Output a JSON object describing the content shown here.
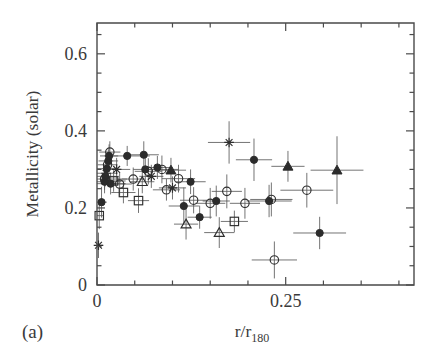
{
  "figure": {
    "panel_label": "(a)",
    "background": "#ffffff",
    "ink_color": "#2e2e2e",
    "errorbar_color": "#5b5b5b"
  },
  "chart_data": {
    "type": "scatter",
    "title": "",
    "subtitle": "",
    "xlabel": "r/r_180",
    "xlabel_base": "r/r",
    "xlabel_sub": "180",
    "ylabel": "Metallicity (solar)",
    "xlim": [
      0,
      0.42
    ],
    "ylim": [
      0,
      0.68
    ],
    "grid": false,
    "legend": "none",
    "x_major_ticks": [
      0,
      0.25
    ],
    "x_major_tick_labels": [
      "0",
      "0.25"
    ],
    "x_minor_ticks": [
      0.05,
      0.1,
      0.15,
      0.2,
      0.3,
      0.35,
      0.4
    ],
    "y_major_ticks": [
      0,
      0.2,
      0.4,
      0.6
    ],
    "y_major_tick_labels": [
      "0",
      "0.2",
      "0.4",
      "0.6"
    ],
    "y_minor_ticks": [
      0.05,
      0.1,
      0.15,
      0.25,
      0.3,
      0.35,
      0.45,
      0.5,
      0.55,
      0.65
    ],
    "marker_kinds": [
      "filled-circle",
      "open-circle",
      "open-square",
      "open-triangle",
      "filled-triangle",
      "asterisk"
    ],
    "points": [
      {
        "x": 0.002,
        "y": 0.103,
        "xerr": 0.006,
        "yerr": 0.033,
        "marker": "asterisk"
      },
      {
        "x": 0.003,
        "y": 0.18,
        "xerr": 0.006,
        "yerr": 0.035,
        "marker": "open-square"
      },
      {
        "x": 0.006,
        "y": 0.215,
        "xerr": 0.007,
        "yerr": 0.04,
        "marker": "filled-circle"
      },
      {
        "x": 0.01,
        "y": 0.268,
        "xerr": 0.022,
        "yerr": 0.03,
        "marker": "filled-circle"
      },
      {
        "x": 0.01,
        "y": 0.275,
        "xerr": 0.03,
        "yerr": 0.028,
        "marker": "open-circle"
      },
      {
        "x": 0.011,
        "y": 0.282,
        "xerr": 0.018,
        "yerr": 0.026,
        "marker": "filled-circle"
      },
      {
        "x": 0.012,
        "y": 0.29,
        "xerr": 0.015,
        "yerr": 0.03,
        "marker": "asterisk"
      },
      {
        "x": 0.013,
        "y": 0.302,
        "xerr": 0.014,
        "yerr": 0.03,
        "marker": "filled-circle"
      },
      {
        "x": 0.014,
        "y": 0.312,
        "xerr": 0.013,
        "yerr": 0.032,
        "marker": "open-circle"
      },
      {
        "x": 0.015,
        "y": 0.322,
        "xerr": 0.013,
        "yerr": 0.03,
        "marker": "filled-circle"
      },
      {
        "x": 0.016,
        "y": 0.335,
        "xerr": 0.012,
        "yerr": 0.03,
        "marker": "filled-circle"
      },
      {
        "x": 0.017,
        "y": 0.345,
        "xerr": 0.014,
        "yerr": 0.028,
        "marker": "open-circle"
      },
      {
        "x": 0.018,
        "y": 0.263,
        "xerr": 0.02,
        "yerr": 0.028,
        "marker": "filled-circle"
      },
      {
        "x": 0.022,
        "y": 0.27,
        "xerr": 0.016,
        "yerr": 0.028,
        "marker": "open-square"
      },
      {
        "x": 0.026,
        "y": 0.3,
        "xerr": 0.018,
        "yerr": 0.03,
        "marker": "asterisk"
      },
      {
        "x": 0.03,
        "y": 0.262,
        "xerr": 0.016,
        "yerr": 0.03,
        "marker": "open-circle"
      },
      {
        "x": 0.035,
        "y": 0.24,
        "xerr": 0.016,
        "yerr": 0.028,
        "marker": "open-square"
      },
      {
        "x": 0.04,
        "y": 0.335,
        "xerr": 0.03,
        "yerr": 0.026,
        "marker": "filled-circle"
      },
      {
        "x": 0.048,
        "y": 0.275,
        "xerr": 0.015,
        "yerr": 0.03,
        "marker": "open-circle"
      },
      {
        "x": 0.055,
        "y": 0.219,
        "xerr": 0.014,
        "yerr": 0.032,
        "marker": "open-square"
      },
      {
        "x": 0.06,
        "y": 0.268,
        "xerr": 0.016,
        "yerr": 0.03,
        "marker": "open-triangle"
      },
      {
        "x": 0.062,
        "y": 0.338,
        "xerr": 0.02,
        "yerr": 0.035,
        "marker": "filled-circle"
      },
      {
        "x": 0.064,
        "y": 0.3,
        "xerr": 0.016,
        "yerr": 0.032,
        "marker": "filled-circle"
      },
      {
        "x": 0.068,
        "y": 0.295,
        "xerr": 0.018,
        "yerr": 0.034,
        "marker": "open-circle"
      },
      {
        "x": 0.072,
        "y": 0.282,
        "xerr": 0.016,
        "yerr": 0.03,
        "marker": "asterisk"
      },
      {
        "x": 0.08,
        "y": 0.305,
        "xerr": 0.02,
        "yerr": 0.03,
        "marker": "filled-circle"
      },
      {
        "x": 0.086,
        "y": 0.3,
        "xerr": 0.022,
        "yerr": 0.036,
        "marker": "open-circle"
      },
      {
        "x": 0.092,
        "y": 0.247,
        "xerr": 0.018,
        "yerr": 0.028,
        "marker": "open-circle"
      },
      {
        "x": 0.098,
        "y": 0.298,
        "xerr": 0.02,
        "yerr": 0.032,
        "marker": "filled-triangle"
      },
      {
        "x": 0.1,
        "y": 0.252,
        "xerr": 0.018,
        "yerr": 0.03,
        "marker": "asterisk"
      },
      {
        "x": 0.108,
        "y": 0.276,
        "xerr": 0.022,
        "yerr": 0.036,
        "marker": "open-circle"
      },
      {
        "x": 0.115,
        "y": 0.205,
        "xerr": 0.02,
        "yerr": 0.048,
        "marker": "filled-circle"
      },
      {
        "x": 0.118,
        "y": 0.158,
        "xerr": 0.016,
        "yerr": 0.04,
        "marker": "open-triangle"
      },
      {
        "x": 0.124,
        "y": 0.268,
        "xerr": 0.02,
        "yerr": 0.032,
        "marker": "filled-circle"
      },
      {
        "x": 0.128,
        "y": 0.22,
        "xerr": 0.018,
        "yerr": 0.034,
        "marker": "open-circle"
      },
      {
        "x": 0.136,
        "y": 0.176,
        "xerr": 0.016,
        "yerr": 0.03,
        "marker": "filled-circle"
      },
      {
        "x": 0.15,
        "y": 0.212,
        "xerr": 0.02,
        "yerr": 0.04,
        "marker": "open-circle"
      },
      {
        "x": 0.158,
        "y": 0.218,
        "xerr": 0.018,
        "yerr": 0.04,
        "marker": "filled-circle"
      },
      {
        "x": 0.162,
        "y": 0.136,
        "xerr": 0.02,
        "yerr": 0.04,
        "marker": "open-triangle"
      },
      {
        "x": 0.172,
        "y": 0.243,
        "xerr": 0.02,
        "yerr": 0.044,
        "marker": "open-circle"
      },
      {
        "x": 0.175,
        "y": 0.37,
        "xerr": 0.028,
        "yerr": 0.055,
        "marker": "asterisk"
      },
      {
        "x": 0.182,
        "y": 0.165,
        "xerr": 0.018,
        "yerr": 0.028,
        "marker": "open-square"
      },
      {
        "x": 0.196,
        "y": 0.212,
        "xerr": 0.02,
        "yerr": 0.04,
        "marker": "open-circle"
      },
      {
        "x": 0.208,
        "y": 0.325,
        "xerr": 0.024,
        "yerr": 0.055,
        "marker": "filled-circle"
      },
      {
        "x": 0.228,
        "y": 0.218,
        "xerr": 0.03,
        "yerr": 0.042,
        "marker": "filled-circle"
      },
      {
        "x": 0.231,
        "y": 0.222,
        "xerr": 0.028,
        "yerr": 0.044,
        "marker": "open-circle"
      },
      {
        "x": 0.235,
        "y": 0.065,
        "xerr": 0.03,
        "yerr": 0.048,
        "marker": "open-circle"
      },
      {
        "x": 0.253,
        "y": 0.308,
        "xerr": 0.022,
        "yerr": 0.04,
        "marker": "filled-triangle"
      },
      {
        "x": 0.278,
        "y": 0.246,
        "xerr": 0.035,
        "yerr": 0.045,
        "marker": "open-circle"
      },
      {
        "x": 0.295,
        "y": 0.135,
        "xerr": 0.035,
        "yerr": 0.042,
        "marker": "filled-circle"
      },
      {
        "x": 0.318,
        "y": 0.298,
        "xerr": 0.035,
        "yerr": 0.088,
        "marker": "filled-triangle"
      }
    ]
  }
}
